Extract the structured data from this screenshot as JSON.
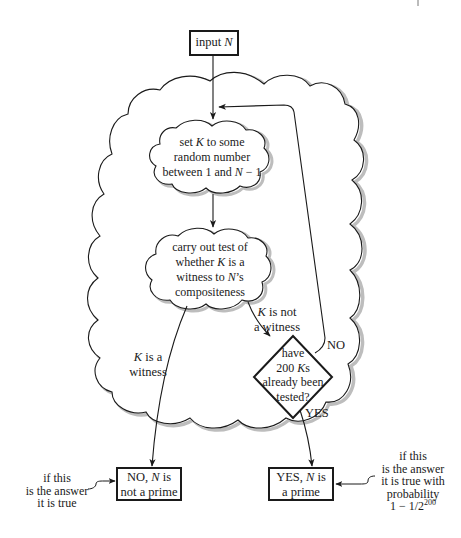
{
  "diagram": {
    "type": "flowchart",
    "colors": {
      "stroke": "#1a1a1a",
      "shadow": "#b8b8b8",
      "background": "#ffffff"
    },
    "nodes": {
      "input": {
        "shape": "rectangle",
        "label_pre": "input ",
        "label_var": "N"
      },
      "set_k": {
        "shape": "cloud",
        "lines": [
          {
            "pre": "set ",
            "var": "K",
            "post": " to some"
          },
          {
            "pre": "random number",
            "var": "",
            "post": ""
          },
          {
            "pre": "between 1 and ",
            "var": "N",
            "post": " − 1"
          }
        ]
      },
      "test": {
        "shape": "cloud",
        "lines": [
          {
            "pre": "carry out test of",
            "var": "",
            "post": ""
          },
          {
            "pre": "whether ",
            "var": "K",
            "post": " is a"
          },
          {
            "pre": "witness to ",
            "var": "N",
            "post": "’s"
          },
          {
            "pre": "compositeness",
            "var": "",
            "post": ""
          }
        ]
      },
      "decision": {
        "shape": "diamond",
        "lines": [
          {
            "pre": "have",
            "var": "",
            "post": ""
          },
          {
            "pre": "200 ",
            "var": "K",
            "post": "s"
          },
          {
            "pre": "already been",
            "var": "",
            "post": ""
          },
          {
            "pre": "tested?",
            "var": "",
            "post": ""
          }
        ]
      },
      "no_prime": {
        "shape": "rectangle",
        "lines": [
          {
            "pre": "NO, ",
            "var": "N",
            "post": " is"
          },
          {
            "pre": "not a prime",
            "var": "",
            "post": ""
          }
        ]
      },
      "yes_prime": {
        "shape": "rectangle",
        "lines": [
          {
            "pre": "YES, ",
            "var": "N",
            "post": " is"
          },
          {
            "pre": "a prime",
            "var": "",
            "post": ""
          }
        ]
      }
    },
    "edge_labels": {
      "is_witness": [
        {
          "pre": "",
          "var": "K",
          "post": " is a"
        },
        {
          "pre": "witness",
          "var": "",
          "post": ""
        }
      ],
      "not_witness": [
        {
          "pre": "",
          "var": "K",
          "post": " is not"
        },
        {
          "pre": "a witness",
          "var": "",
          "post": ""
        }
      ],
      "no": "NO",
      "yes": "YES"
    },
    "annotations": {
      "no_note": [
        "if this",
        "is the answer",
        "it is true"
      ],
      "yes_note": {
        "lines": [
          "if this",
          "is the answer",
          "it is true with",
          "probability"
        ],
        "formula_base": "1 − 1/2",
        "formula_exp": "200"
      }
    }
  }
}
